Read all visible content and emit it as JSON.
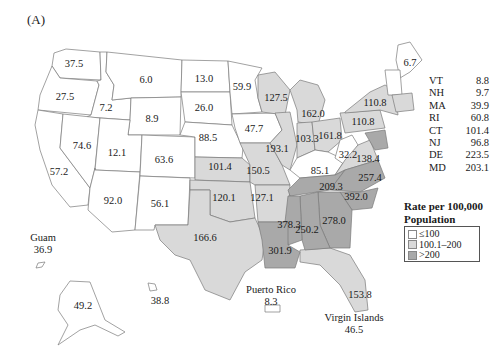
{
  "panel_label": "(A)",
  "colors": {
    "low": "#ffffff",
    "mid": "#d9d9d9",
    "high": "#a9a9a9",
    "border": "#7a7a7a"
  },
  "legend": {
    "title_line1": "Rate per 100,000",
    "title_line2": "Population",
    "items": [
      {
        "label": "≤100",
        "class": "low"
      },
      {
        "label": "100.1–200",
        "class": "mid"
      },
      {
        "label": ">200",
        "class": "high"
      }
    ]
  },
  "small_states_table": [
    {
      "state": "VT",
      "value": "8.8"
    },
    {
      "state": "NH",
      "value": "9.7"
    },
    {
      "state": "MA",
      "value": "39.9"
    },
    {
      "state": "RI",
      "value": "60.8"
    },
    {
      "state": "CT",
      "value": "101.4"
    },
    {
      "state": "NJ",
      "value": "96.8"
    },
    {
      "state": "DE",
      "value": "223.5"
    },
    {
      "state": "MD",
      "value": "203.1"
    }
  ],
  "state_values": {
    "WA": "37.5",
    "OR": "27.5",
    "CA": "57.2",
    "ID": "7.2",
    "NV": "74.6",
    "MT": "6.0",
    "WY": "8.9",
    "UT": "12.1",
    "AZ": "92.0",
    "CO": "63.6",
    "NM": "56.1",
    "ND": "13.0",
    "SD": "26.0",
    "NE": "88.5",
    "KS": "101.4",
    "OK": "120.1",
    "TX": "166.6",
    "MN": "59.9",
    "IA": "47.7",
    "MO": "150.5",
    "AR": "127.1",
    "LA": "301.9",
    "WI": "127.5",
    "IL": "193.1",
    "MI": "162.0",
    "IN": "103.3",
    "OH": "161.8",
    "KY": "85.1",
    "TN": "209.3",
    "MS": "378.3",
    "AL": "250.2",
    "GA": "278.0",
    "FL": "153.8",
    "SC": "392.0",
    "NC": "257.4",
    "VA": "138.4",
    "WV": "32.2",
    "PA": "110.8",
    "NY": "110.8",
    "ME": "6.7",
    "AK": "49.2",
    "HI": "38.8"
  },
  "territories": {
    "guam": {
      "name": "Guam",
      "value": "36.9"
    },
    "puerto_rico": {
      "name": "Puerto Rico",
      "value": "8.3"
    },
    "virgin_islands": {
      "name": "Virgin Islands",
      "value": "46.5"
    }
  }
}
